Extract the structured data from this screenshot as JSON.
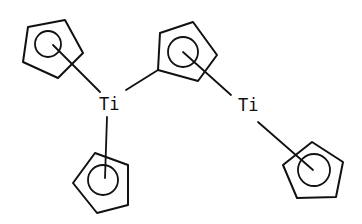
{
  "diagram": {
    "type": "chemical-structure",
    "atoms": [
      {
        "id": "ti_left",
        "label": "Ti"
      },
      {
        "id": "ti_right",
        "label": "Ti"
      }
    ],
    "rings": [
      {
        "id": "cp_top_left",
        "type": "cyclopentadienyl",
        "bonded_to": "ti_left"
      },
      {
        "id": "cp_bottom_left",
        "type": "cyclopentadienyl",
        "bonded_to": "ti_left"
      },
      {
        "id": "cp_center",
        "type": "cyclopentadienyl",
        "bonded_to": [
          "ti_left",
          "ti_right"
        ]
      },
      {
        "id": "cp_bottom_right",
        "type": "cyclopentadienyl",
        "bonded_to": "ti_right"
      }
    ]
  }
}
